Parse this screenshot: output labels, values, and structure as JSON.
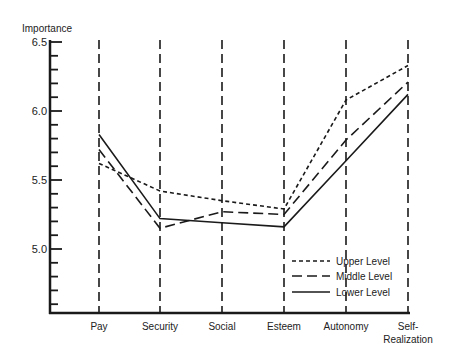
{
  "chart_data": {
    "type": "line",
    "title": "",
    "ylabel": "Importance",
    "xlabel": "",
    "ylim": [
      4.5,
      6.5
    ],
    "yticks": [
      {
        "value": 6.5,
        "label": "6.5"
      },
      {
        "value": 6.0,
        "label": "6.0"
      },
      {
        "value": 5.5,
        "label": "5.5"
      },
      {
        "value": 5.0,
        "label": "5.0"
      }
    ],
    "categories": [
      "Pay",
      "Security",
      "Social",
      "Esteem",
      "Autonomy",
      "Self-Realization"
    ],
    "category_labels": [
      [
        "Pay"
      ],
      [
        "Security"
      ],
      [
        "Social"
      ],
      [
        "Esteem"
      ],
      [
        "Autonomy"
      ],
      [
        "Self-",
        "Realization"
      ]
    ],
    "grid": "vertical dashed lines at each category",
    "legend_position": "lower right",
    "series": [
      {
        "name": "Upper Level",
        "style": "short-dash",
        "values": [
          5.62,
          5.42,
          5.35,
          5.29,
          6.08,
          6.33
        ]
      },
      {
        "name": "Middle Level",
        "style": "long-dash",
        "values": [
          5.72,
          5.15,
          5.27,
          5.25,
          5.79,
          6.21
        ]
      },
      {
        "name": "Lower Level",
        "style": "solid",
        "values": [
          5.83,
          5.22,
          5.19,
          5.16,
          5.64,
          6.12
        ]
      }
    ]
  },
  "colors": {
    "line": "#1a1a1a",
    "background": "#ffffff"
  }
}
